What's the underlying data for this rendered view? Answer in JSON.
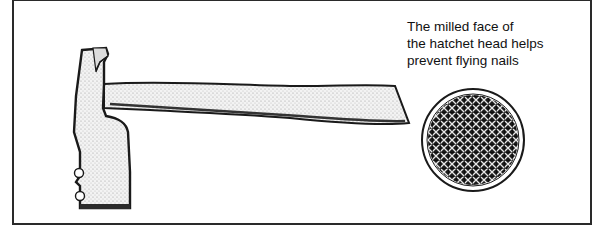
{
  "figure": {
    "caption_lines": [
      "The milled face of",
      "the hatchet head helps",
      "prevent flying nails"
    ],
    "illustrations": {
      "hatchet": "hatchet-side-view",
      "detail": "milled-face-closeup"
    }
  }
}
